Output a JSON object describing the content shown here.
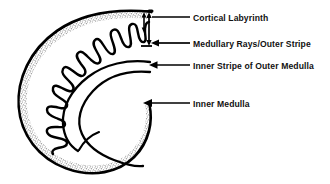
{
  "figure": {
    "background_color": "#ffffff",
    "ink_color": "#000000",
    "stipple_color": "#6b6b6b"
  },
  "labels": [
    {
      "id": "cortical-labyrinth",
      "text": "Cortical Labyrinth",
      "leader": "horizontal-line-to-bracket",
      "arrow": "double-headed-vertical-bracket"
    },
    {
      "id": "medullary-rays-outer-stripe",
      "text": "Medullary Rays/Outer Stripe",
      "leader": "horizontal-line-left-arrow",
      "arrow": "left"
    },
    {
      "id": "inner-stripe-of-outer-medulla",
      "text": "Inner Stripe of Outer Medulla",
      "leader": "horizontal-line-left-arrow",
      "arrow": "left"
    },
    {
      "id": "inner-medulla",
      "text": "Inner Medulla",
      "leader": "horizontal-line-left-arrow",
      "arrow": "left"
    }
  ],
  "regions": [
    {
      "id": "cortex",
      "name": "Cortex",
      "fill": "stipple"
    },
    {
      "id": "medullary-rays",
      "name": "Medullary rays",
      "fill": "white"
    },
    {
      "id": "outer-medulla-inner-stripe",
      "name": "Inner stripe of outer medulla",
      "fill": "white"
    },
    {
      "id": "inner-medulla",
      "name": "Inner medulla",
      "fill": "white"
    }
  ]
}
